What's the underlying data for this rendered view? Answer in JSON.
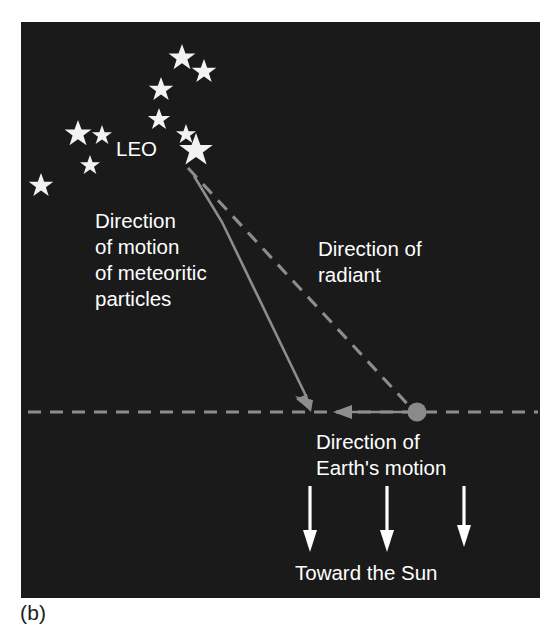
{
  "figure": {
    "caption": "(b)",
    "panel_background": "#1a1a1a",
    "text_color": "#ffffff",
    "line_color": "#8d8d8d",
    "star_color": "#f2f2f2"
  },
  "labels": {
    "constellation": "LEO",
    "meteor_direction_line1": "Direction",
    "meteor_direction_line2": "of motion",
    "meteor_direction_line3": "of meteoritic",
    "meteor_direction_line4": "particles",
    "radiant_direction_line1": "Direction of",
    "radiant_direction_line2": "radiant",
    "earth_motion_line1": "Direction of",
    "earth_motion_line2": "Earth's motion",
    "toward_sun": "Toward the Sun"
  },
  "stars": [
    {
      "name": "star-leo-1",
      "x": 182,
      "y": 56,
      "r": 12
    },
    {
      "name": "star-leo-2",
      "x": 204,
      "y": 70,
      "r": 11
    },
    {
      "name": "star-leo-3",
      "x": 161,
      "y": 88,
      "r": 11
    },
    {
      "name": "star-leo-4",
      "x": 159,
      "y": 118,
      "r": 10
    },
    {
      "name": "star-leo-5",
      "x": 186,
      "y": 133,
      "r": 9
    },
    {
      "name": "star-leo-6",
      "x": 196,
      "y": 148,
      "r": 15
    },
    {
      "name": "star-leo-7",
      "x": 78,
      "y": 132,
      "r": 12
    },
    {
      "name": "star-leo-8",
      "x": 102,
      "y": 134,
      "r": 9
    },
    {
      "name": "star-leo-9",
      "x": 90,
      "y": 164,
      "r": 9
    },
    {
      "name": "star-leo-10",
      "x": 41,
      "y": 184,
      "r": 11
    }
  ],
  "geometry": {
    "horizontal_axis_y": 412,
    "horizontal_axis_x1": 28,
    "horizontal_axis_x2": 538,
    "earth_dot_x": 417,
    "earth_dot_y": 412,
    "earth_dot_r": 9,
    "radiant_start_x": 188,
    "radiant_start_y": 168,
    "radiant_end_x": 417,
    "radiant_end_y": 412,
    "meteor_branch_x": 222,
    "meteor_branch_y": 222,
    "meteor_end_x": 310,
    "meteor_end_y": 406,
    "earth_arrow_tip_x": 337,
    "earth_arrow_tail_x": 417,
    "sun_arrows_x": [
      310,
      387,
      464
    ],
    "sun_arrow_top_y": 486,
    "sun_arrow_bottom_y": 550
  }
}
